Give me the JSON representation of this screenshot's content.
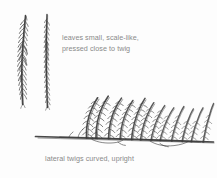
{
  "figure": {
    "background_color": "#fdfdfd",
    "ink_color": "#3a3a3a",
    "text_color": "#8a8a8a"
  },
  "annotations": {
    "leaf_note": {
      "line1": "leaves small, scale-like,",
      "line2": "pressed close to twig"
    },
    "caption": "lateral twigs curved, upright"
  },
  "drawings": {
    "twig_left": {
      "name": "vertical twig with scale leaves, left",
      "x": 18,
      "y_top": 15,
      "y_bottom": 105
    },
    "twig_middle": {
      "name": "vertical twig with scale leaves, right",
      "x": 45,
      "y_top": 14,
      "y_bottom": 108
    },
    "branch": {
      "name": "horizontal branch with upright lateral twigs",
      "x_start": 35,
      "x_end": 214,
      "baseline_y": 138,
      "lateral_twig_count": 13
    }
  }
}
